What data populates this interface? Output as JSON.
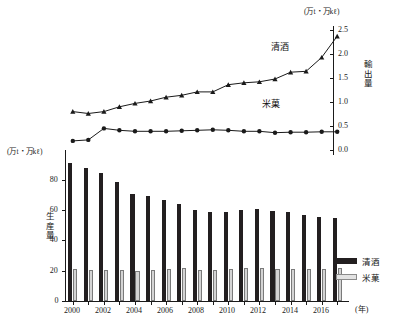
{
  "chart_data": {
    "type": "bar",
    "title": "",
    "subtitle": "",
    "xlabel": "(年)",
    "categories": [
      2000,
      2001,
      2002,
      2003,
      2004,
      2005,
      2006,
      2007,
      2008,
      2009,
      2010,
      2011,
      2012,
      2013,
      2014,
      2015,
      2016,
      2017
    ],
    "x_tick_labels": [
      "2000",
      "",
      "2002",
      "",
      "2004",
      "",
      "2006",
      "",
      "2008",
      "",
      "2010",
      "",
      "2012",
      "",
      "2014",
      "",
      "2016",
      ""
    ],
    "left_axis": {
      "label": "生産量",
      "unit": "(万t・万kℓ)",
      "ylim": [
        0,
        95
      ],
      "ticks": [
        0,
        20,
        40,
        60,
        80
      ],
      "tick_labels": [
        "0",
        "20",
        "40",
        "60",
        "80"
      ]
    },
    "right_axis": {
      "label": "輸出量",
      "unit": "(万t・万kℓ)",
      "ylim": [
        0,
        2.5
      ],
      "ticks": [
        0.0,
        0.5,
        1.0,
        1.5,
        2.0,
        2.5
      ],
      "tick_labels": [
        "0.0",
        "0.5",
        "1.0",
        "1.5",
        "2.0",
        "2.5"
      ]
    },
    "grid": false,
    "legend_position": "bottom-right",
    "series": [
      {
        "name": "清酒",
        "kind": "bar",
        "axis": "left",
        "color": "#231f20",
        "values": [
          91.0,
          87.5,
          84.5,
          78.5,
          70.5,
          69.0,
          66.5,
          64.0,
          60.0,
          59.0,
          58.5,
          60.0,
          61.0,
          59.5,
          59.0,
          56.5,
          55.5,
          54.5
        ]
      },
      {
        "name": "米菓",
        "kind": "bar",
        "axis": "left",
        "color": "#d4d4d4",
        "values": [
          21.0,
          20.3,
          20.4,
          20.8,
          20.1,
          20.8,
          21.2,
          21.5,
          20.6,
          20.6,
          21.0,
          21.9,
          21.6,
          20.9,
          21.2,
          21.0,
          21.2,
          21.7
        ]
      },
      {
        "name": "清酒",
        "kind": "line",
        "axis": "right",
        "color": "#1a1a1a",
        "marker": "triangle",
        "values": [
          0.8,
          0.76,
          0.8,
          0.9,
          0.97,
          1.02,
          1.1,
          1.14,
          1.21,
          1.21,
          1.36,
          1.4,
          1.42,
          1.48,
          1.62,
          1.64,
          1.93,
          2.37
        ]
      },
      {
        "name": "米菓",
        "kind": "line",
        "axis": "right",
        "color": "#1a1a1a",
        "marker": "circle",
        "values": [
          0.19,
          0.21,
          0.45,
          0.41,
          0.39,
          0.39,
          0.39,
          0.4,
          0.41,
          0.42,
          0.41,
          0.39,
          0.39,
          0.36,
          0.37,
          0.37,
          0.38,
          0.38
        ]
      }
    ],
    "annotations": [
      {
        "name": "sake-line-label",
        "text": "清酒"
      },
      {
        "name": "beika-line-label",
        "text": "米菓"
      }
    ]
  },
  "legend": {
    "items": [
      {
        "label": "清酒",
        "color": "#231f20"
      },
      {
        "label": "米菓",
        "color": "#e2e2e2"
      }
    ]
  }
}
